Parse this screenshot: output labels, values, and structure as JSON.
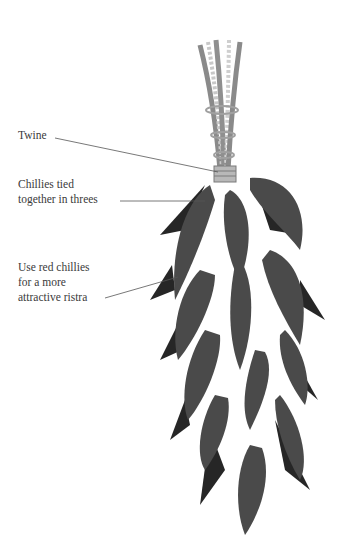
{
  "diagram": {
    "labels": [
      {
        "id": "twine",
        "text": "Twine",
        "x": 18,
        "y": 128
      },
      {
        "id": "tied",
        "text": "Chillies tied\ntogether in threes",
        "x": 18,
        "y": 177
      },
      {
        "id": "red",
        "text": "Use red chillies\nfor a more\nattractive ristra",
        "x": 18,
        "y": 260
      }
    ],
    "colors": {
      "chilli": "#4a4a4a",
      "chilli_shadow": "#262626",
      "twine_light": "#bdbdbd",
      "twine_dark": "#8a8a8a",
      "leader_line": "#555555",
      "text": "#3a3a3a"
    }
  }
}
